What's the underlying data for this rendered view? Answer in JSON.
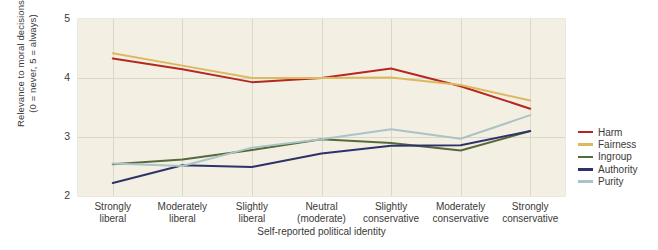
{
  "chart_data": {
    "type": "line",
    "title": "",
    "xlabel": "Self-reported political identity",
    "ylabel_line1": "Relevance to moral decisions",
    "ylabel_line2": "(0 = never, 5 = always)",
    "categories": [
      "Strongly liberal",
      "Moderately liberal",
      "Slightly liberal",
      "Neutral (moderate)",
      "Slightly conservative",
      "Moderately conservative",
      "Strongly conservative"
    ],
    "category_lines": [
      [
        "Strongly",
        "liberal"
      ],
      [
        "Moderately",
        "liberal"
      ],
      [
        "Slightly",
        "liberal"
      ],
      [
        "Neutral",
        "(moderate)"
      ],
      [
        "Slightly",
        "conservative"
      ],
      [
        "Moderately",
        "conservative"
      ],
      [
        "Strongly",
        "conservative"
      ]
    ],
    "ylim": [
      2,
      5
    ],
    "yticks": [
      2,
      3,
      4,
      5
    ],
    "ytick_labels": [
      "2",
      "3",
      "4",
      "5"
    ],
    "grid": true,
    "legend_position": "right",
    "series": [
      {
        "name": "Harm",
        "color": "#b52822",
        "values": [
          4.33,
          4.15,
          3.93,
          4.0,
          4.16,
          3.86,
          3.48
        ]
      },
      {
        "name": "Fairness",
        "color": "#dcb95f",
        "values": [
          4.42,
          4.21,
          4.0,
          4.0,
          4.01,
          3.88,
          3.62
        ]
      },
      {
        "name": "Ingroup",
        "color": "#56693a",
        "values": [
          2.54,
          2.62,
          2.78,
          2.96,
          2.9,
          2.77,
          3.1
        ]
      },
      {
        "name": "Authority",
        "color": "#2d3268",
        "values": [
          2.22,
          2.52,
          2.49,
          2.72,
          2.85,
          2.86,
          3.1
        ]
      },
      {
        "name": "Purity",
        "color": "#a9c3c6",
        "values": [
          2.55,
          2.51,
          2.82,
          2.96,
          3.13,
          2.97,
          3.37
        ]
      }
    ]
  },
  "legend": {
    "items": [
      {
        "label": "Harm",
        "color": "#b52822"
      },
      {
        "label": "Fairness",
        "color": "#dcb95f"
      },
      {
        "label": "Ingroup",
        "color": "#56693a"
      },
      {
        "label": "Authority",
        "color": "#2d3268"
      },
      {
        "label": "Purity",
        "color": "#a9c3c6"
      }
    ]
  },
  "plot_style": {
    "background": "#f3f0e3",
    "gridline_color": "#dcd8c7",
    "text_color": "#3a3a38"
  }
}
